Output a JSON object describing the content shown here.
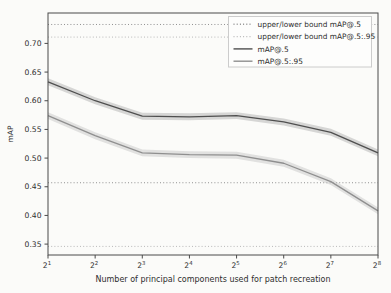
{
  "figure": {
    "background": "#fbfbf9",
    "plot_background": "#fcfcfa"
  },
  "chart_data": {
    "type": "line",
    "title": "",
    "xlabel": "Number of principal components used for patch recreation",
    "ylabel": "mAP",
    "x_scale": "log2",
    "x_tick_base": "2",
    "x_tick_exponents": [
      "1",
      "2",
      "3",
      "4",
      "5",
      "6",
      "7",
      "8"
    ],
    "x_values": [
      2,
      4,
      8,
      16,
      32,
      64,
      128,
      256
    ],
    "y_tick_labels": [
      "0.35",
      "0.40",
      "0.45",
      "0.50",
      "0.55",
      "0.60",
      "0.65",
      "0.70"
    ],
    "ylim": [
      0.331,
      0.753
    ],
    "grid": false,
    "legend_position": "upper right",
    "band_halfwidth": 0.006,
    "axis_color": "#4a4a4a",
    "tick_label_color": "#2e2e2e",
    "series": [
      {
        "name": "mAP@.5",
        "color": "#4f4f4f",
        "band_color": "#a8a8a8",
        "values": [
          0.633,
          0.6,
          0.573,
          0.572,
          0.574,
          0.563,
          0.545,
          0.509
        ]
      },
      {
        "name": "mAP@.5:.95",
        "color": "#8f8f8f",
        "band_color": "#c2c2c2",
        "values": [
          0.574,
          0.539,
          0.509,
          0.506,
          0.505,
          0.491,
          0.459,
          0.408
        ]
      }
    ],
    "bounds": [
      {
        "name": "upper/lower bound mAP@.5",
        "color": "#909090",
        "values": [
          0.733,
          0.457
        ]
      },
      {
        "name": "upper/lower bound mAP@.5:.95",
        "color": "#b8b8b8",
        "values": [
          0.711,
          0.346
        ]
      }
    ],
    "legend": {
      "border_color": "#cccccc",
      "background": "#fdfdfc",
      "text_color": "#2e2e2e"
    }
  }
}
